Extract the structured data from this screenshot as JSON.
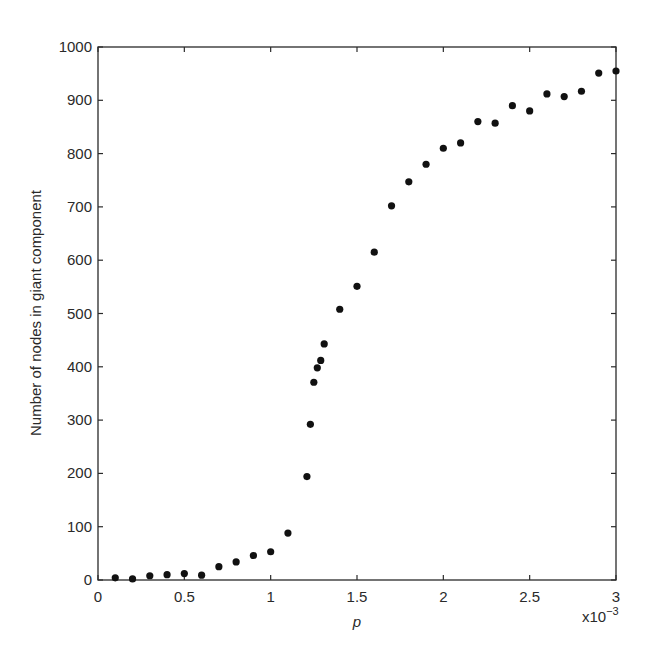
{
  "chart_data": {
    "type": "scatter",
    "title": "",
    "xlabel": "p",
    "x_multiplier_label": "x10",
    "x_multiplier_exponent": "−3",
    "ylabel": "Number of nodes in giant component",
    "xlim": [
      0,
      3
    ],
    "ylim": [
      0,
      1000
    ],
    "x_unit_scale": 0.001,
    "grid": false,
    "legend": null,
    "xticks": [
      0,
      0.5,
      1,
      1.5,
      2,
      2.5,
      3
    ],
    "xtick_labels": [
      "0",
      "0.5",
      "1",
      "1.5",
      "2",
      "2.5",
      "3"
    ],
    "yticks": [
      0,
      100,
      200,
      300,
      400,
      500,
      600,
      700,
      800,
      900,
      1000
    ],
    "ytick_labels": [
      "0",
      "100",
      "200",
      "300",
      "400",
      "500",
      "600",
      "700",
      "800",
      "900",
      "1000"
    ],
    "series": [
      {
        "name": "giant component size",
        "marker": "filled-circle",
        "color": "#111111",
        "x": [
          0.1,
          0.2,
          0.3,
          0.4,
          0.5,
          0.6,
          0.7,
          0.8,
          0.9,
          1.0,
          1.1,
          1.21,
          1.23,
          1.25,
          1.27,
          1.29,
          1.31,
          1.4,
          1.5,
          1.6,
          1.7,
          1.8,
          1.9,
          2.0,
          2.1,
          2.2,
          2.3,
          2.4,
          2.5,
          2.6,
          2.7,
          2.8,
          2.9,
          3.0
        ],
        "y": [
          4,
          2,
          8,
          10,
          12,
          9,
          25,
          34,
          46,
          53,
          88,
          194,
          292,
          371,
          398,
          412,
          443,
          508,
          551,
          615,
          702,
          747,
          780,
          810,
          820,
          860,
          857,
          890,
          880,
          912,
          907,
          917,
          951,
          955
        ]
      }
    ]
  },
  "colors": {
    "background": "#ffffff",
    "axis": "#2a2a2a",
    "marker": "#111111"
  }
}
